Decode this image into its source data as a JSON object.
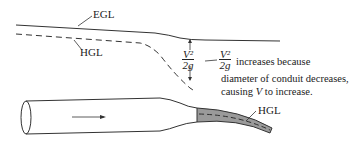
{
  "labels": {
    "egl": "EGL",
    "hgl_upper": "HGL",
    "hgl_lower": "HGL"
  },
  "velocity_head": {
    "numerator": "V²",
    "denominator": "2g"
  },
  "annotation": {
    "frac_numerator": "V²",
    "frac_denominator": "2g",
    "line1_suffix": "increases because",
    "line2": "diameter of conduit decreases,",
    "line3_prefix": "causing ",
    "line3_var": "V",
    "line3_suffix": " to increase."
  },
  "flow_direction": "right"
}
